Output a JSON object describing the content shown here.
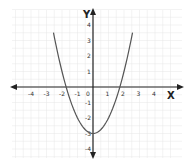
{
  "chart_data": {
    "type": "line",
    "title": "",
    "xlabel": "X",
    "ylabel": "Y",
    "xlim": [
      -5,
      5
    ],
    "ylim": [
      -4,
      4
    ],
    "x_ticks": [
      -4,
      -3,
      -2,
      -1,
      0,
      1,
      2,
      3,
      4
    ],
    "y_ticks": [
      4,
      3,
      2,
      1,
      -1,
      -2,
      -3,
      -4
    ],
    "grid": true,
    "series": [
      {
        "name": "y = x^2 - 3",
        "x": [
          -2.55,
          -2,
          -1.73,
          -1,
          0,
          1,
          1.73,
          2,
          2.55
        ],
        "values": [
          3.5,
          1,
          0,
          -2,
          -3,
          -2,
          0,
          1,
          3.5
        ]
      }
    ],
    "colors": {
      "curve": "#555555",
      "axes": "#222222",
      "grid": "#e6e6e6"
    }
  }
}
